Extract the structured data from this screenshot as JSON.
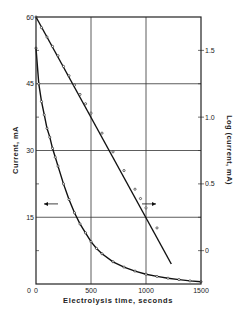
{
  "chart_data": {
    "type": "line",
    "title": "",
    "xlabel": "Electrolysis time, seconds",
    "ylabel": "Current, mA",
    "ylabel_right": "Log (current, mA)",
    "xlim": [
      0,
      1500
    ],
    "ylim": [
      0,
      60
    ],
    "ylim_right": [
      -0.25,
      1.75
    ],
    "x_ticks": [
      "0",
      "500",
      "1000",
      "1500"
    ],
    "y_ticks": [
      "0",
      "15",
      "30",
      "45",
      "60"
    ],
    "y_ticks_right": [
      "0",
      "0.5",
      "1.0",
      "1.5"
    ],
    "grid": true,
    "legend": "none (arrows indicate axis: left arrow → current curve, right arrow → log line)",
    "series": [
      {
        "name": "Current, mA (left axis)",
        "axis": "left",
        "style": "curve with open circles",
        "x": [
          0,
          25,
          50,
          75,
          100,
          125,
          150,
          175,
          200,
          250,
          300,
          350,
          400,
          450,
          500,
          550,
          600,
          700,
          800,
          900,
          1000,
          1100,
          1200,
          1300,
          1400,
          1500
        ],
        "y": [
          53,
          45,
          41,
          38,
          35,
          33,
          30.5,
          28.5,
          26.5,
          22.5,
          19,
          16,
          13.5,
          11.5,
          9.5,
          8,
          6.8,
          5,
          3.8,
          2.9,
          2.2,
          1.7,
          1.3,
          1.0,
          0.7,
          0.5
        ]
      },
      {
        "name": "Log (current, mA) (right axis)",
        "axis": "right",
        "style": "straight line with open circles",
        "x": [
          0,
          50,
          100,
          150,
          200,
          250,
          300,
          350,
          400,
          450,
          500,
          600,
          700,
          800,
          900,
          950,
          1000,
          1100,
          1230
        ],
        "y": [
          1.75,
          1.67,
          1.6,
          1.53,
          1.46,
          1.38,
          1.31,
          1.24,
          1.17,
          1.1,
          1.03,
          0.88,
          0.74,
          0.6,
          0.46,
          0.39,
          0.32,
          0.17,
          -0.1
        ]
      }
    ],
    "annotations": [
      {
        "type": "arrow",
        "direction": "left",
        "x": 200,
        "y_left": 18
      },
      {
        "type": "arrow",
        "direction": "right",
        "x": 1000,
        "y_left": 18
      }
    ]
  },
  "labels": {
    "xlabel": "Electrolysis time, seconds",
    "ylabel": "Current, mA",
    "ylabel_right": "Log (current, mA)"
  }
}
